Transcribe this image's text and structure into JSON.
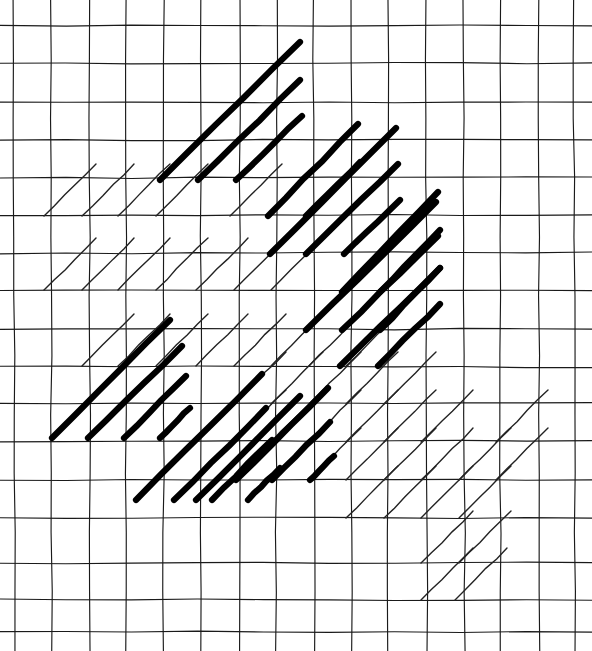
{
  "figure": {
    "kind": "line-diagram",
    "canvas": {
      "width": 592,
      "height": 651,
      "background": "#ffffff"
    },
    "ink_color": "#111111",
    "grid": {
      "label": "graph-paper-grid",
      "stroke": "#1a1a1a",
      "stroke_width": 1.15,
      "hand_drawn": true,
      "x_lines": [
        14,
        51.5,
        89,
        126.5,
        164,
        201.5,
        239,
        276.5,
        314,
        351.5,
        389,
        426.5,
        464,
        501.5,
        539,
        574.5
      ],
      "y_lines": [
        25,
        63,
        101.5,
        140,
        178,
        215.5,
        253,
        290.5,
        328.5,
        366.5,
        404,
        442,
        480,
        518,
        563,
        600,
        632
      ],
      "x_extent": [
        0,
        592
      ],
      "y_extent": [
        0,
        651
      ]
    },
    "hatch": {
      "label": "diagonal-hatch-strokes",
      "angle_degrees": 45,
      "direction": "lower-left to upper-right",
      "weights": {
        "thin": 1.4,
        "thick": 6.2
      },
      "thin_color": "#232323",
      "thick_color": "#000000",
      "thin_strokes": [
        [
          44,
          216,
          96,
          164
        ],
        [
          82,
          216,
          134,
          164
        ],
        [
          118,
          216,
          170,
          164
        ],
        [
          156,
          216,
          208,
          164
        ],
        [
          230,
          216,
          282,
          164
        ],
        [
          44,
          290,
          96,
          238
        ],
        [
          82,
          290,
          134,
          238
        ],
        [
          118,
          290,
          170,
          238
        ],
        [
          156,
          290,
          208,
          238
        ],
        [
          196,
          290,
          248,
          238
        ],
        [
          234,
          290,
          286,
          238
        ],
        [
          271,
          290,
          323,
          238
        ],
        [
          156,
          366,
          208,
          314
        ],
        [
          196,
          366,
          248,
          314
        ],
        [
          234,
          366,
          286,
          314
        ],
        [
          271,
          366,
          323,
          314
        ],
        [
          309,
          366,
          361,
          314
        ],
        [
          346,
          366,
          398,
          314
        ],
        [
          234,
          404,
          286,
          352
        ],
        [
          271,
          404,
          323,
          352
        ],
        [
          309,
          404,
          361,
          352
        ],
        [
          346,
          404,
          398,
          352
        ],
        [
          384,
          404,
          436,
          352
        ],
        [
          309,
          442,
          361,
          390
        ],
        [
          346,
          442,
          398,
          390
        ],
        [
          384,
          442,
          436,
          390
        ],
        [
          421,
          442,
          473,
          390
        ],
        [
          309,
          480,
          361,
          428
        ],
        [
          346,
          480,
          398,
          428
        ],
        [
          384,
          480,
          436,
          428
        ],
        [
          421,
          480,
          473,
          428
        ],
        [
          459,
          480,
          511,
          428
        ],
        [
          384,
          518,
          436,
          466
        ],
        [
          421,
          518,
          473,
          466
        ],
        [
          459,
          518,
          511,
          466
        ],
        [
          346,
          518,
          398,
          466
        ],
        [
          421,
          563,
          473,
          511
        ],
        [
          459,
          563,
          511,
          511
        ],
        [
          421,
          600,
          473,
          548
        ],
        [
          455,
          600,
          507,
          548
        ],
        [
          196,
          442,
          248,
          390
        ],
        [
          234,
          442,
          286,
          390
        ],
        [
          271,
          442,
          323,
          390
        ],
        [
          82,
          366,
          134,
          314
        ],
        [
          118,
          366,
          170,
          314
        ],
        [
          496,
          442,
          548,
          390
        ],
        [
          496,
          480,
          548,
          428
        ]
      ],
      "thick_strokes": [
        [
          160,
          180,
          300,
          42
        ],
        [
          198,
          180,
          300,
          80
        ],
        [
          236,
          180,
          302,
          116
        ],
        [
          268,
          216,
          358,
          124
        ],
        [
          306,
          216,
          360,
          162
        ],
        [
          270,
          254,
          396,
          128
        ],
        [
          306,
          254,
          398,
          164
        ],
        [
          344,
          254,
          400,
          200
        ],
        [
          342,
          292,
          438,
          192
        ],
        [
          380,
          292,
          440,
          230
        ],
        [
          306,
          330,
          436,
          202
        ],
        [
          342,
          330,
          438,
          236
        ],
        [
          380,
          330,
          440,
          268
        ],
        [
          340,
          366,
          440,
          268
        ],
        [
          378,
          366,
          440,
          304
        ],
        [
          52,
          438,
          170,
          320
        ],
        [
          88,
          438,
          182,
          346
        ],
        [
          124,
          438,
          186,
          376
        ],
        [
          160,
          438,
          190,
          408
        ],
        [
          136,
          500,
          262,
          374
        ],
        [
          174,
          500,
          266,
          408
        ],
        [
          212,
          500,
          272,
          440
        ],
        [
          248,
          500,
          280,
          468
        ],
        [
          236,
          480,
          328,
          388
        ],
        [
          272,
          480,
          330,
          422
        ],
        [
          310,
          480,
          334,
          456
        ],
        [
          196,
          500,
          300,
          396
        ]
      ]
    }
  }
}
